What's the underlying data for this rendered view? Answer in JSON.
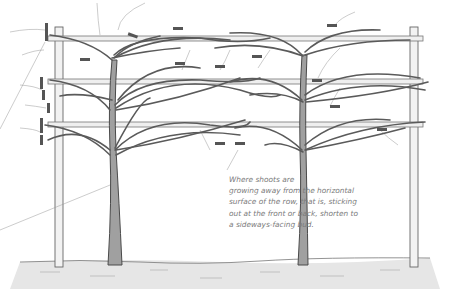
{
  "figure": {
    "colors": {
      "line": "#4a4a4a",
      "branch_fill": "#9a9a9a",
      "label_tag": "#555555",
      "leader_line": "#999999",
      "ground": "#d8d8d8",
      "caption": "#7a7a7a"
    }
  },
  "annotation": {
    "lines": [
      "Where shoots are",
      "growing away from the horizontal",
      "surface of the row, that is, sticking",
      "out at the front or back, shorten to",
      "a sideways-facing bud."
    ]
  }
}
